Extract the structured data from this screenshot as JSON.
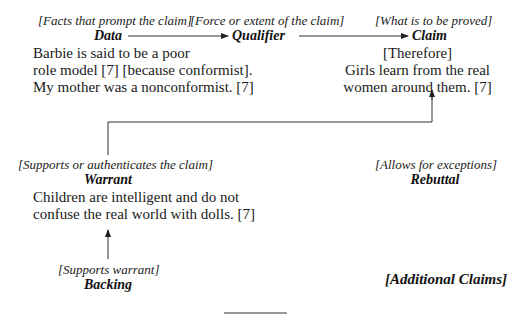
{
  "diagram": {
    "type": "toulmin-argument-model",
    "data": {
      "hint": "[Facts that prompt the claim]",
      "label": "Data",
      "text_lines": [
        "Barbie is said to be a poor",
        "role model [7] [because conformist].",
        "My mother was a nonconformist. [7]"
      ]
    },
    "qualifier": {
      "hint": "[Force or extent of the claim]",
      "label": "Qualifier"
    },
    "claim": {
      "hint": "[What is to be proved]",
      "label": "Claim",
      "text_lines": [
        "[Therefore]",
        "Girls learn from the real",
        "women around them. [7]"
      ]
    },
    "warrant": {
      "hint": "[Supports or authenticates the claim]",
      "label": "Warrant",
      "text_lines": [
        "Children are intelligent and do not",
        "confuse the real world with dolls. [7]"
      ]
    },
    "rebuttal": {
      "hint": "[Allows for exceptions]",
      "label": "Rebuttal"
    },
    "backing": {
      "hint": "[Supports warrant]",
      "label": "Backing"
    },
    "additional_claims": {
      "label": "[Additional Claims]"
    },
    "colors": {
      "text": "#1a1a1a",
      "lines": "#333333",
      "background": "#ffffff"
    }
  }
}
